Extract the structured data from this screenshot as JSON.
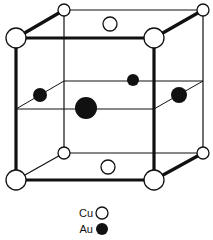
{
  "figure": {
    "type": "crystal unit cell",
    "colors": {
      "line": "#111111",
      "cu_fill": "#ffffff",
      "au_fill": "#111111"
    }
  },
  "legend": {
    "items": [
      {
        "label": "Cu",
        "symbol": "open-circle"
      },
      {
        "label": "Au",
        "symbol": "filled-circle"
      }
    ]
  },
  "atoms": {
    "cu": [
      {
        "pos": "front-top-left",
        "cx": 16,
        "cy": 38,
        "r": 10
      },
      {
        "pos": "front-top-right",
        "cx": 154,
        "cy": 38,
        "r": 10
      },
      {
        "pos": "back-top-left",
        "cx": 64,
        "cy": 10,
        "r": 6
      },
      {
        "pos": "back-top-right",
        "cx": 203,
        "cy": 10,
        "r": 6
      },
      {
        "pos": "front-bottom-left",
        "cx": 16,
        "cy": 180,
        "r": 10
      },
      {
        "pos": "front-bottom-right",
        "cx": 154,
        "cy": 180,
        "r": 10
      },
      {
        "pos": "back-bottom-left",
        "cx": 64,
        "cy": 153,
        "r": 6
      },
      {
        "pos": "back-bottom-right",
        "cx": 203,
        "cy": 153,
        "r": 6
      },
      {
        "pos": "top-face-center",
        "cx": 110,
        "cy": 24,
        "r": 7
      },
      {
        "pos": "bottom-face-center",
        "cx": 108,
        "cy": 167,
        "r": 7
      }
    ],
    "au": [
      {
        "pos": "left-face-center",
        "cx": 40,
        "cy": 95,
        "r": 7
      },
      {
        "pos": "back-face-center",
        "cx": 133,
        "cy": 80,
        "r": 6
      },
      {
        "pos": "front-face-center",
        "cx": 86,
        "cy": 108,
        "r": 11
      },
      {
        "pos": "right-face-center",
        "cx": 179,
        "cy": 95,
        "r": 8
      }
    ]
  }
}
